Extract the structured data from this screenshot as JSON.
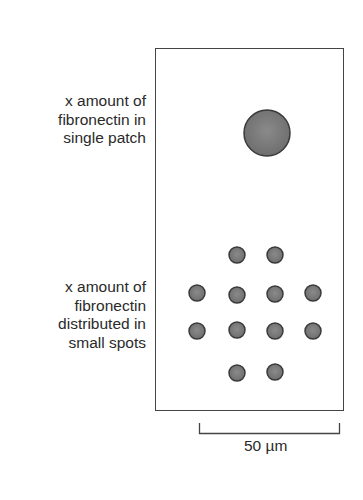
{
  "labels": {
    "single_patch": "x amount of\nfibronectin in\nsingle patch",
    "small_spots": "x amount of\nfibronectin\ndistributed in\nsmall spots"
  },
  "scale_bar": {
    "label": "50 µm"
  },
  "colors": {
    "spot_fill": "#7d7d7d",
    "spot_stroke": "#3a3a3a",
    "border": "#444444"
  },
  "large_patch": {
    "cx": 267,
    "cy": 133,
    "r": 23
  },
  "small_spots": {
    "r": 8,
    "positions": [
      [
        237,
        255
      ],
      [
        275,
        255
      ],
      [
        197,
        293
      ],
      [
        237,
        295
      ],
      [
        275,
        294
      ],
      [
        313,
        293
      ],
      [
        197,
        331
      ],
      [
        237,
        330
      ],
      [
        275,
        331
      ],
      [
        313,
        331
      ],
      [
        237,
        373
      ],
      [
        275,
        372
      ]
    ]
  }
}
